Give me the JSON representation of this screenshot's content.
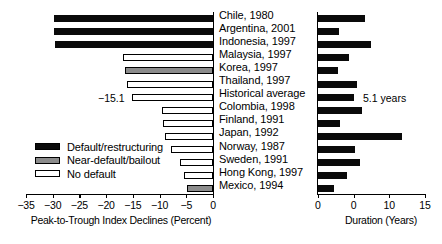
{
  "chart_data": {
    "type": "bar",
    "title": "",
    "subtitle": "",
    "orientation": "horizontal",
    "panels": [
      {
        "name": "left",
        "xlabel": "Peak-to-Trough Index Declines (Percent)",
        "ylabel": "",
        "xlim": [
          -35,
          0
        ],
        "xticks": [
          -35,
          -30,
          -25,
          -20,
          -15,
          -10,
          -5,
          0
        ],
        "xticklabels": [
          "−35",
          "−30",
          "−25",
          "−20",
          "−15",
          "−10",
          "−5",
          "0"
        ],
        "grid": false
      },
      {
        "name": "right",
        "xlabel": "Duration (Years)",
        "ylabel": "",
        "xlim": [
          0,
          15
        ],
        "xticks": [
          0,
          5,
          10,
          15
        ],
        "xticklabels": [
          "0",
          "0",
          "10",
          "15"
        ],
        "grid": false
      }
    ],
    "categories": [
      "Chile, 1980",
      "Argentina, 2001",
      "Indonesia, 1997",
      "Malaysia, 1997",
      "Korea, 1997",
      "Thailand, 1997",
      "Historical average",
      "Colombia, 1998",
      "Finland, 1991",
      "Japan, 1992",
      "Norway, 1987",
      "Sweden, 1991",
      "Hong Kong, 1997",
      "Mexico, 1994"
    ],
    "series": [
      {
        "name": "Peak-to-Trough Index Declines (Percent)",
        "panel": "left",
        "values": [
          -29.8,
          -29.7,
          -29.5,
          -16.9,
          -16.5,
          -16.1,
          -15.1,
          -9.6,
          -9.3,
          -8.9,
          -7.9,
          -6.2,
          -5.4,
          -4.8
        ]
      },
      {
        "name": "Duration (Years)",
        "panel": "right",
        "values": [
          6.6,
          2.9,
          7.4,
          4.3,
          2.8,
          5.5,
          5.1,
          6.2,
          3.1,
          11.8,
          5.2,
          5.9,
          4.1,
          2.2
        ]
      }
    ],
    "category_status": [
      "default",
      "default",
      "default",
      "none",
      "near",
      "none",
      "none",
      "none",
      "none",
      "none",
      "none",
      "none",
      "none",
      "near"
    ],
    "annotations": [
      {
        "text": "−15.1",
        "panel": "left",
        "category": "Historical average"
      },
      {
        "text": "5.1 years",
        "panel": "right",
        "category": "Historical average"
      }
    ],
    "legend": {
      "position": "lower-left",
      "entries": [
        {
          "label": "Default/restructuring",
          "key": "default",
          "color": "#0a0a0a"
        },
        {
          "label": "Near-default/bailout",
          "key": "near",
          "color": "#8c8c8c"
        },
        {
          "label": "No default",
          "key": "none",
          "color": "#ffffff"
        }
      ]
    },
    "colors": {
      "default": "#0a0a0a",
      "near": "#8c8c8c",
      "none": "#ffffff",
      "axis": "#000000",
      "background": "#ffffff"
    }
  }
}
